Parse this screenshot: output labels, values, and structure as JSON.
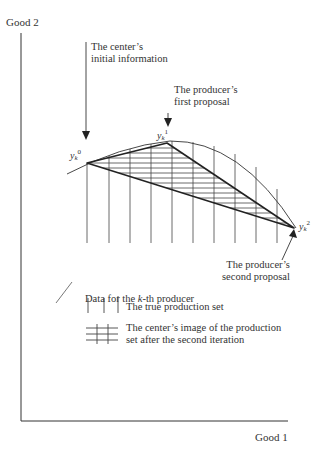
{
  "axes": {
    "y_label": "Good 2",
    "x_label": "Good 1"
  },
  "points": {
    "y0": {
      "base": "y",
      "sub": "k",
      "sup": "0"
    },
    "y1": {
      "base": "y",
      "sub": "k",
      "sup": "1"
    },
    "y2": {
      "base": "y",
      "sub": "k",
      "sup": "2"
    }
  },
  "annotations": {
    "center_initial": [
      "The center’s",
      "initial information"
    ],
    "first_proposal": [
      "The producer’s",
      "first proposal"
    ],
    "second_proposal": [
      "The producer’s",
      "second proposal"
    ]
  },
  "legend": {
    "title_prefix": "Data for the ",
    "title_k": "k",
    "title_suffix": "-th producer",
    "true_set": "The true production set",
    "center_image": [
      "The center’s image of the production",
      "set after the second iteration"
    ]
  },
  "colors": {
    "ink": "#2a2a2a",
    "background": "#ffffff"
  }
}
